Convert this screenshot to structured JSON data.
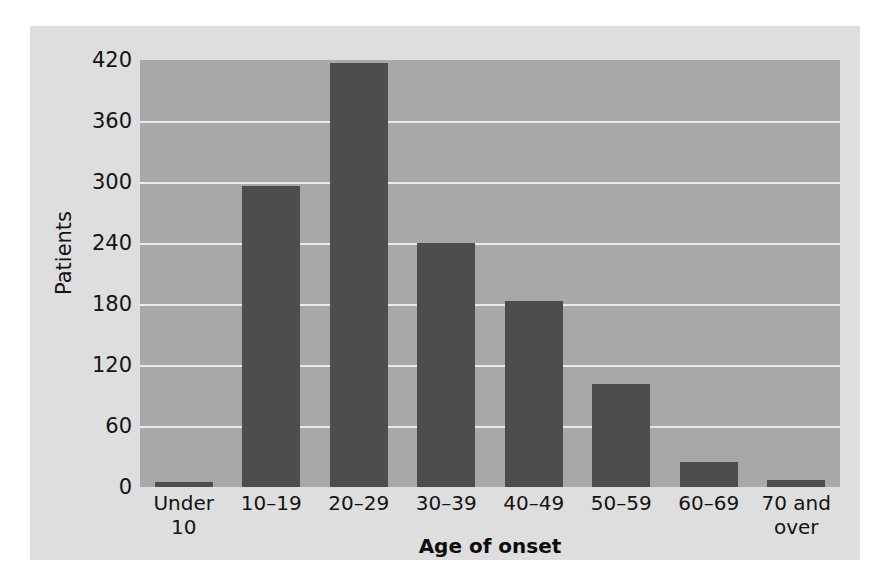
{
  "chart_data": {
    "type": "bar",
    "title": "",
    "xlabel": "Age of onset",
    "ylabel": "Patients",
    "categories": [
      "Under 10",
      "10–19",
      "20–29",
      "30–39",
      "40–49",
      "50–59",
      "60–69",
      "70 and over"
    ],
    "values": [
      5,
      296,
      417,
      240,
      183,
      101,
      25,
      7
    ],
    "yticks": [
      420,
      360,
      300,
      240,
      180,
      120,
      60,
      0
    ],
    "ylim": [
      0,
      420
    ],
    "grid": true,
    "legend": "none",
    "colors": {
      "bar": "#4d4d4d",
      "plot_background": "#a8a8a8",
      "figure_background": "#dedede",
      "gridline": "#eceae6",
      "text": "#131313"
    }
  }
}
